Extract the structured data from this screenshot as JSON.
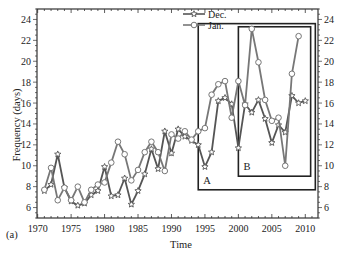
{
  "panel_label": "(a)",
  "chart_data": {
    "type": "line",
    "title": "",
    "xlabel": "Time",
    "ylabel": "Frequency (days)",
    "xlim": [
      1969.9,
      2011.9
    ],
    "ylim": [
      5,
      25
    ],
    "x_ticks": [
      1970,
      1975,
      1980,
      1985,
      1990,
      1995,
      2000,
      2005,
      2010
    ],
    "y_ticks": [
      6,
      8,
      10,
      12,
      14,
      16,
      18,
      20,
      22,
      24
    ],
    "y_axis_both_sides": true,
    "grid": false,
    "legend_position": "top-right inside",
    "series": [
      {
        "name": "Dec.",
        "marker": "star",
        "color": "#555555",
        "x": [
          1971,
          1972,
          1973,
          1974,
          1975,
          1976,
          1977,
          1978,
          1979,
          1980,
          1981,
          1982,
          1983,
          1984,
          1985,
          1986,
          1987,
          1988,
          1989,
          1990,
          1991,
          1992,
          1993,
          1994,
          1995,
          1996,
          1997,
          1998,
          1999,
          2000,
          2001,
          2002,
          2003,
          2004,
          2005,
          2006,
          2007,
          2008,
          2009,
          2010
        ],
        "values": [
          7.6,
          8.2,
          11.1,
          7.9,
          6.6,
          6.2,
          6.4,
          7.2,
          7.6,
          9.9,
          7.1,
          7.2,
          8.8,
          6.3,
          7.6,
          9.2,
          11.6,
          9.7,
          13.3,
          11.2,
          13.5,
          12.8,
          12.4,
          12.0,
          9.9,
          11.3,
          16.2,
          16.5,
          15.9,
          11.7,
          15.9,
          15.1,
          16.3,
          14.5,
          12.2,
          13.9,
          13.2,
          16.7,
          16.0,
          16.2
        ]
      },
      {
        "name": "Jan.",
        "marker": "circle",
        "color": "#777777",
        "x": [
          1971,
          1972,
          1973,
          1974,
          1975,
          1976,
          1977,
          1978,
          1979,
          1980,
          1981,
          1982,
          1983,
          1984,
          1985,
          1986,
          1987,
          1988,
          1989,
          1990,
          1991,
          1992,
          1993,
          1994,
          1995,
          1996,
          1997,
          1998,
          1999,
          2000,
          2001,
          2002,
          2003,
          2004,
          2005,
          2006,
          2007,
          2008,
          2009,
          2010
        ],
        "values": [
          7.7,
          9.8,
          6.7,
          7.9,
          6.7,
          8.0,
          6.5,
          7.7,
          8.2,
          8.4,
          10.3,
          12.3,
          11.1,
          8.6,
          9.6,
          11.3,
          12.3,
          11.3,
          9.5,
          13.0,
          12.6,
          13.3,
          12.5,
          13.3,
          13.6,
          16.8,
          17.8,
          18.1,
          14.6,
          18.1,
          15.8,
          23.1,
          19.9,
          16.3,
          14.3,
          14.6,
          10.0,
          18.8,
          22.4,
          null
        ]
      }
    ],
    "annotations": [
      {
        "label": "A",
        "type": "box",
        "x": [
          1994,
          2011.5
        ],
        "y": [
          7.7,
          23.6
        ]
      },
      {
        "label": "B",
        "type": "box",
        "x": [
          2000,
          2010.8
        ],
        "y": [
          9.0,
          23.3
        ]
      }
    ]
  }
}
